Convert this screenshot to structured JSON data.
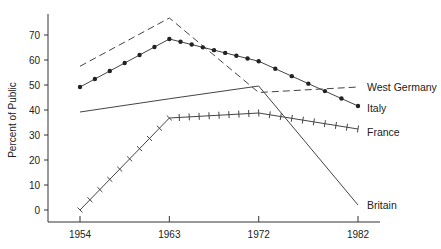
{
  "chart_data": {
    "type": "line",
    "title": "",
    "xlabel": "",
    "ylabel": "Percent of Public",
    "x": [
      1954,
      1963,
      1972,
      1982
    ],
    "x_tick_labels": [
      "1954",
      "1963",
      "1972",
      "1982"
    ],
    "y_ticks": [
      0,
      10,
      20,
      30,
      40,
      50,
      60,
      70
    ],
    "y_tick_labels": [
      "0",
      "10",
      "20",
      "30",
      "40",
      "50",
      "60",
      "70"
    ],
    "ylim": [
      -2,
      80
    ],
    "xlim": [
      1954,
      1982
    ],
    "grid": false,
    "legend": "inline-right",
    "series": [
      {
        "name": "West Germany",
        "label": "West Germany",
        "style": "dashed",
        "marker": "none",
        "values": [
          57.5,
          76.8,
          47.0,
          49.2
        ]
      },
      {
        "name": "Italy",
        "label": "Italy",
        "style": "solid",
        "marker": "dot",
        "values": [
          49.2,
          68.4,
          59.5,
          41.6
        ]
      },
      {
        "name": "France",
        "label": "France",
        "style": "solid",
        "marker": "tick",
        "values": [
          0,
          36.8,
          38.8,
          32.4
        ]
      },
      {
        "name": "Britain",
        "label": "Britain",
        "style": "solid",
        "marker": "none",
        "values": [
          39.2,
          44.5,
          49.6,
          2
        ]
      }
    ]
  }
}
